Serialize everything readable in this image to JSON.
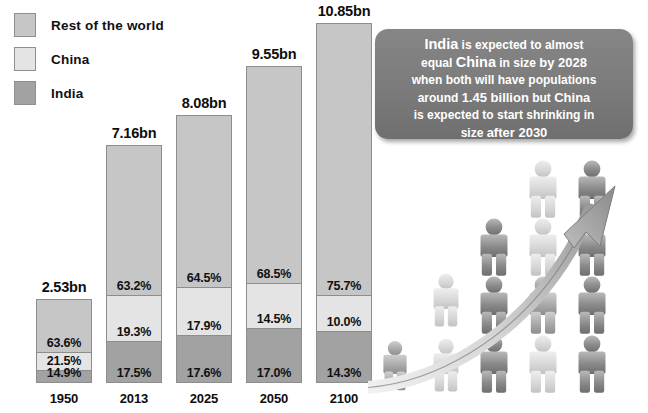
{
  "legend": {
    "items": [
      {
        "label": "Rest of the world",
        "color": "#c6c6c6"
      },
      {
        "label": "China",
        "color": "#e4e4e4"
      },
      {
        "label": "India",
        "color": "#a2a2a2"
      }
    ]
  },
  "callout": {
    "lines": [
      [
        {
          "t": "India",
          "s": "big"
        },
        {
          "t": " is expected to almost",
          "s": "sm"
        }
      ],
      [
        {
          "t": "equal ",
          "s": "sm"
        },
        {
          "t": "China",
          "s": "big"
        },
        {
          "t": " in size ",
          "s": "sm"
        },
        {
          "t": "by 2028",
          "s": "md"
        }
      ],
      [
        {
          "t": "when both will have populations",
          "s": "sm"
        }
      ],
      [
        {
          "t": "around ",
          "s": "sm"
        },
        {
          "t": "1.45 billion",
          "s": "md"
        },
        {
          "t": " but ",
          "s": "sm"
        },
        {
          "t": "China",
          "s": "md"
        }
      ],
      [
        {
          "t": "is expected to start shrinking in",
          "s": "sm"
        }
      ],
      [
        {
          "t": "size ",
          "s": "sm"
        },
        {
          "t": "after 2030",
          "s": "md"
        }
      ]
    ],
    "plain": "India is expected to almost equal China in size by 2028 when both will have populations around 1.45 billion but China is expected to start shrinking in size after 2030"
  },
  "chart_data": {
    "type": "bar",
    "title": "",
    "xlabel": "",
    "ylabel": "",
    "stacked": true,
    "units": "billions of people",
    "grid": false,
    "legend_position": "top-left",
    "categories": [
      "1950",
      "2013",
      "2025",
      "2050",
      "2100"
    ],
    "totals": [
      2.53,
      7.16,
      8.08,
      9.55,
      10.85
    ],
    "total_labels": [
      "2.53bn",
      "7.16bn",
      "8.08bn",
      "9.55bn",
      "10.85bn"
    ],
    "series": [
      {
        "name": "Rest of the world",
        "color": "#c6c6c6",
        "values": [
          63.6,
          63.2,
          64.5,
          68.5,
          75.7
        ],
        "labels": [
          "63.6%",
          "63.2%",
          "64.5%",
          "68.5%",
          "75.7%"
        ]
      },
      {
        "name": "China",
        "color": "#e4e4e4",
        "values": [
          21.5,
          19.3,
          17.9,
          14.5,
          10.0
        ],
        "labels": [
          "21.5%",
          "19.3%",
          "17.9%",
          "14.5%",
          "10.0%"
        ]
      },
      {
        "name": "India",
        "color": "#a2a2a2",
        "values": [
          14.9,
          17.5,
          17.6,
          17.0,
          14.3
        ],
        "labels": [
          "14.9%",
          "17.5%",
          "17.6%",
          "17.0%",
          "14.3%"
        ]
      }
    ]
  },
  "bars": [
    {
      "year": "1950",
      "total": "2.53bn",
      "rest": "63.6%",
      "china": "21.5%",
      "india": "14.9%"
    },
    {
      "year": "2013",
      "total": "7.16bn",
      "rest": "63.2%",
      "china": "19.3%",
      "india": "17.5%"
    },
    {
      "year": "2025",
      "total": "8.08bn",
      "rest": "64.5%",
      "china": "17.9%",
      "india": "17.6%"
    },
    {
      "year": "2050",
      "total": "9.55bn",
      "rest": "68.5%",
      "china": "14.5%",
      "india": "17.0%"
    },
    {
      "year": "2100",
      "total": "10.85bn",
      "rest": "75.7%",
      "china": "10.0%",
      "india": "14.3%"
    }
  ],
  "art": {
    "arrow_name": "growth-arrow",
    "figure_name": "person-pictogram"
  }
}
